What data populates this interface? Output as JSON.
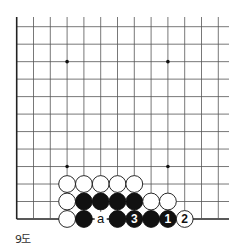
{
  "diagram": {
    "caption": "9도",
    "board": {
      "cols": 13,
      "rows": 12,
      "x0": 16.7,
      "y0": 26.7,
      "dx": 16.8,
      "dy": 17.48,
      "right_extend": 229,
      "left_edge": true,
      "bottom_edge": true,
      "line_color": "#555555",
      "edge_color": "#222222",
      "star_points": [
        [
          3,
          2
        ],
        [
          9,
          2
        ],
        [
          3,
          8
        ],
        [
          9,
          8
        ]
      ]
    },
    "stones": [
      {
        "col": 3,
        "row": 9,
        "color": "white"
      },
      {
        "col": 4,
        "row": 9,
        "color": "white"
      },
      {
        "col": 5,
        "row": 9,
        "color": "white"
      },
      {
        "col": 6,
        "row": 9,
        "color": "white"
      },
      {
        "col": 7,
        "row": 9,
        "color": "white"
      },
      {
        "col": 3,
        "row": 10,
        "color": "white"
      },
      {
        "col": 4,
        "row": 10,
        "color": "black"
      },
      {
        "col": 5,
        "row": 10,
        "color": "black"
      },
      {
        "col": 6,
        "row": 10,
        "color": "black"
      },
      {
        "col": 7,
        "row": 10,
        "color": "black"
      },
      {
        "col": 8,
        "row": 10,
        "color": "white"
      },
      {
        "col": 9,
        "row": 10,
        "color": "white"
      },
      {
        "col": 3,
        "row": 11,
        "color": "white"
      },
      {
        "col": 4,
        "row": 11,
        "color": "black"
      },
      {
        "col": 6,
        "row": 11,
        "color": "black"
      },
      {
        "col": 7,
        "row": 11,
        "color": "black",
        "label": "3"
      },
      {
        "col": 8,
        "row": 11,
        "color": "black"
      },
      {
        "col": 9,
        "row": 11,
        "color": "black",
        "label": "1"
      },
      {
        "col": 10,
        "row": 11,
        "color": "white",
        "label": "2"
      }
    ],
    "marks": [
      {
        "col": 5,
        "row": 11,
        "label": "a"
      }
    ]
  }
}
